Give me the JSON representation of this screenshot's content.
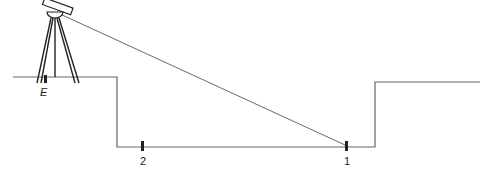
{
  "diagram": {
    "type": "leveling survey cross-section",
    "labels": {
      "instrument_station": "E",
      "point_1": "1",
      "point_2": "2"
    },
    "colors": {
      "line": "#555555",
      "ink": "#222222"
    }
  }
}
